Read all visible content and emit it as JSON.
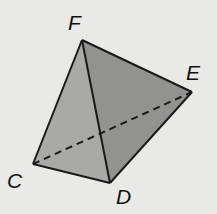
{
  "diagram": {
    "type": "tetrahedron",
    "vertices": {
      "F": {
        "label": "F",
        "x": 82,
        "y": 40
      },
      "E": {
        "label": "E",
        "x": 192,
        "y": 92
      },
      "C": {
        "label": "C",
        "x": 33,
        "y": 164
      },
      "D": {
        "label": "D",
        "x": 110,
        "y": 183
      }
    },
    "edges_solid": [
      "FC",
      "FD",
      "FE",
      "CD",
      "DE"
    ],
    "edges_hidden": [
      "CE"
    ],
    "colors": {
      "background": "#e9e9e7",
      "face_left": "#a9a9a7",
      "face_right": "#929290",
      "edge": "#1a1a1a"
    }
  }
}
